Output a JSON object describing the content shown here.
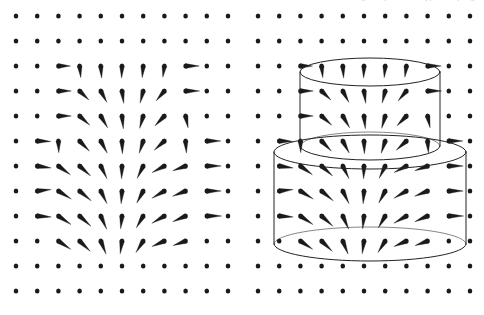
{
  "figure": {
    "width": 484,
    "height": 315,
    "background_color": "#ffffff",
    "ink_color": "#1a1a1a",
    "clipped_header_text": "figure caption text clipped at top edge"
  },
  "panels": [
    {
      "id": "left",
      "name": "vector-field-only",
      "origin_x": 16,
      "origin_y": 16,
      "columns": 11,
      "rows": 12,
      "dx": 21.2,
      "dy": 25.0,
      "has_surfaces": false
    },
    {
      "id": "right",
      "name": "vector-field-with-gaussian-cylinders",
      "origin_x": 258,
      "origin_y": 16,
      "columns": 11,
      "rows": 12,
      "dx": 21.2,
      "dy": 25.0,
      "has_surfaces": true
    }
  ],
  "surfaces": [
    {
      "id": "small-cylinder",
      "label": "upper small cylinder",
      "center_x": 370,
      "top_y": 72,
      "bottom_y": 146,
      "radius_x": 70,
      "radius_y": 14,
      "stroke": "#222222",
      "stroke_width": 1.0
    },
    {
      "id": "large-cylinder",
      "label": "lower large cylinder",
      "center_x": 370,
      "top_y": 152,
      "bottom_y": 244,
      "radius_x": 96,
      "radius_y": 17,
      "stroke": "#222222",
      "stroke_width": 1.0
    }
  ],
  "chart_data": {
    "type": "scatter",
    "xlabel": "",
    "ylabel": "",
    "grid": false,
    "legend": null,
    "lattice": {
      "columns": 11,
      "rows": 12,
      "dx": 21.2,
      "dy": 25.0
    },
    "field_source": {
      "x_index": 4.6,
      "y_index": 5.4
    },
    "vectors": [
      {
        "col": 2,
        "row": 2,
        "angle": 0,
        "mag": 0.62
      },
      {
        "col": 3,
        "row": 2,
        "angle": 84,
        "mag": 0.6
      },
      {
        "col": 4,
        "row": 2,
        "angle": 86,
        "mag": 0.62
      },
      {
        "col": 5,
        "row": 2,
        "angle": 92,
        "mag": 0.62
      },
      {
        "col": 6,
        "row": 2,
        "angle": 95,
        "mag": 0.6
      },
      {
        "col": 7,
        "row": 2,
        "angle": 98,
        "mag": 0.58
      },
      {
        "col": 8,
        "row": 2,
        "angle": 0,
        "mag": 0.7
      },
      {
        "col": 2,
        "row": 3,
        "angle": 0,
        "mag": 0.66
      },
      {
        "col": 3,
        "row": 3,
        "angle": 44,
        "mag": 0.66
      },
      {
        "col": 4,
        "row": 3,
        "angle": 62,
        "mag": 0.66
      },
      {
        "col": 5,
        "row": 3,
        "angle": 82,
        "mag": 0.64
      },
      {
        "col": 6,
        "row": 3,
        "angle": 104,
        "mag": 0.64
      },
      {
        "col": 7,
        "row": 3,
        "angle": 130,
        "mag": 0.66
      },
      {
        "col": 8,
        "row": 3,
        "angle": 0,
        "mag": 0.72
      },
      {
        "col": 2,
        "row": 4,
        "angle": 0,
        "mag": 0.66
      },
      {
        "col": 3,
        "row": 4,
        "angle": 42,
        "mag": 0.7
      },
      {
        "col": 4,
        "row": 4,
        "angle": 60,
        "mag": 0.7
      },
      {
        "col": 5,
        "row": 4,
        "angle": 84,
        "mag": 0.66
      },
      {
        "col": 6,
        "row": 4,
        "angle": 106,
        "mag": 0.66
      },
      {
        "col": 7,
        "row": 4,
        "angle": 134,
        "mag": 0.7
      },
      {
        "col": 8,
        "row": 4,
        "angle": 78,
        "mag": 0.62
      },
      {
        "col": 1,
        "row": 5,
        "angle": 2,
        "mag": 0.7
      },
      {
        "col": 2,
        "row": 5,
        "angle": 88,
        "mag": 0.6
      },
      {
        "col": 3,
        "row": 5,
        "angle": 46,
        "mag": 0.72
      },
      {
        "col": 4,
        "row": 5,
        "angle": 62,
        "mag": 0.7
      },
      {
        "col": 5,
        "row": 5,
        "angle": 88,
        "mag": 0.66
      },
      {
        "col": 6,
        "row": 5,
        "angle": 108,
        "mag": 0.66
      },
      {
        "col": 7,
        "row": 5,
        "angle": 138,
        "mag": 0.7
      },
      {
        "col": 8,
        "row": 5,
        "angle": 86,
        "mag": 0.62
      },
      {
        "col": 9,
        "row": 5,
        "angle": 0,
        "mag": 0.72
      },
      {
        "col": 1,
        "row": 6,
        "angle": 8,
        "mag": 0.72
      },
      {
        "col": 2,
        "row": 6,
        "angle": 36,
        "mag": 0.76
      },
      {
        "col": 3,
        "row": 6,
        "angle": 42,
        "mag": 0.76
      },
      {
        "col": 4,
        "row": 6,
        "angle": 64,
        "mag": 0.72
      },
      {
        "col": 5,
        "row": 6,
        "angle": 92,
        "mag": 0.66
      },
      {
        "col": 6,
        "row": 6,
        "angle": 116,
        "mag": 0.7
      },
      {
        "col": 7,
        "row": 6,
        "angle": 152,
        "mag": 0.72
      },
      {
        "col": 8,
        "row": 6,
        "angle": 160,
        "mag": 0.7
      },
      {
        "col": 9,
        "row": 6,
        "angle": 0,
        "mag": 0.74
      },
      {
        "col": 1,
        "row": 7,
        "angle": -6,
        "mag": 0.72
      },
      {
        "col": 2,
        "row": 7,
        "angle": 32,
        "mag": 0.78
      },
      {
        "col": 3,
        "row": 7,
        "angle": 40,
        "mag": 0.78
      },
      {
        "col": 4,
        "row": 7,
        "angle": 64,
        "mag": 0.72
      },
      {
        "col": 5,
        "row": 7,
        "angle": 94,
        "mag": 0.66
      },
      {
        "col": 6,
        "row": 7,
        "angle": 118,
        "mag": 0.7
      },
      {
        "col": 7,
        "row": 7,
        "angle": 150,
        "mag": 0.74
      },
      {
        "col": 8,
        "row": 7,
        "angle": 158,
        "mag": 0.72
      },
      {
        "col": 9,
        "row": 7,
        "angle": 0,
        "mag": 0.74
      },
      {
        "col": 1,
        "row": 8,
        "angle": 4,
        "mag": 0.72
      },
      {
        "col": 2,
        "row": 8,
        "angle": 34,
        "mag": 0.78
      },
      {
        "col": 3,
        "row": 8,
        "angle": 42,
        "mag": 0.78
      },
      {
        "col": 4,
        "row": 8,
        "angle": 66,
        "mag": 0.74
      },
      {
        "col": 5,
        "row": 8,
        "angle": 96,
        "mag": 0.66
      },
      {
        "col": 6,
        "row": 8,
        "angle": 120,
        "mag": 0.7
      },
      {
        "col": 7,
        "row": 8,
        "angle": 150,
        "mag": 0.74
      },
      {
        "col": 8,
        "row": 8,
        "angle": 156,
        "mag": 0.72
      },
      {
        "col": 9,
        "row": 8,
        "angle": 0,
        "mag": 0.76
      },
      {
        "col": 2,
        "row": 9,
        "angle": 34,
        "mag": 0.76
      },
      {
        "col": 3,
        "row": 9,
        "angle": 44,
        "mag": 0.76
      },
      {
        "col": 4,
        "row": 9,
        "angle": 68,
        "mag": 0.72
      },
      {
        "col": 5,
        "row": 9,
        "angle": 98,
        "mag": 0.66
      },
      {
        "col": 6,
        "row": 9,
        "angle": 122,
        "mag": 0.7
      },
      {
        "col": 7,
        "row": 9,
        "angle": 156,
        "mag": 0.7
      },
      {
        "col": 8,
        "row": 9,
        "angle": 160,
        "mag": 0.68
      }
    ]
  }
}
